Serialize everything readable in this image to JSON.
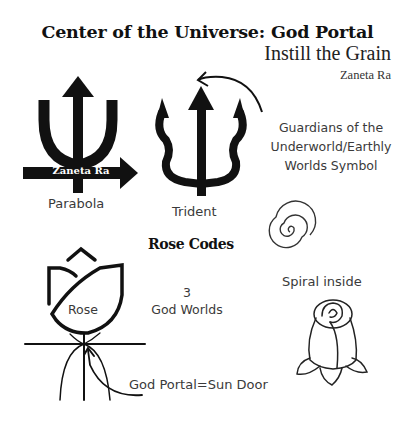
{
  "header": {
    "title": "Center of the Universe: God Portal",
    "subtitle": "Instill the Grain",
    "author": "Zaneta Ra"
  },
  "symbols": {
    "parabola": {
      "label": "Parabola",
      "watermark": "Zaneta Ra"
    },
    "trident": {
      "label": "Trident"
    },
    "guardians_note": {
      "line1": "Guardians of the",
      "line2": "Underworld/Earthly",
      "line3": "Worlds Symbol"
    },
    "spiral": {
      "label": "Spiral inside"
    },
    "rose_codes": {
      "heading": "Rose Codes",
      "count": "3",
      "count_label": "God Worlds"
    },
    "rose": {
      "label": "Rose"
    },
    "god_portal": {
      "label": "God Portal=Sun Door"
    }
  },
  "colors": {
    "ink": "#111111",
    "text": "#3a3a3a",
    "background": "#ffffff"
  }
}
